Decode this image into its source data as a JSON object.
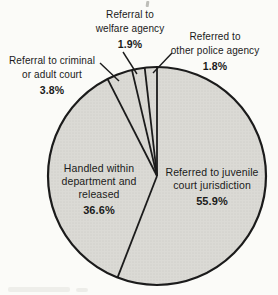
{
  "figure": {
    "background_color": "#fbfbf8"
  },
  "chart_data": {
    "type": "pie",
    "title": "",
    "unit": "percent",
    "direction": "clockwise",
    "start_angle_clockwise_from_top_deg": 0,
    "categories": [
      "Referred to juvenile court jurisdiction",
      "Handled within department and released",
      "Referral to criminal or adult court",
      "Referral to welfare agency",
      "Referred to other police agency"
    ],
    "values": [
      55.9,
      36.6,
      3.8,
      1.9,
      1.8
    ],
    "slices": [
      {
        "category": "Referred to juvenile court jurisdiction",
        "value": 55.9,
        "pct_label": "55.9%",
        "label_lines": [
          "Referred to juvenile",
          "court jurisdiction"
        ],
        "label_placement": "inside-right",
        "leader_line": false
      },
      {
        "category": "Handled within department and released",
        "value": 36.6,
        "pct_label": "36.6%",
        "label_lines": [
          "Handled within",
          "department and",
          "released"
        ],
        "label_placement": "inside-left",
        "leader_line": false
      },
      {
        "category": "Referral to criminal or adult court",
        "value": 3.8,
        "pct_label": "3.8%",
        "label_lines": [
          "Referral to criminal",
          "or adult court"
        ],
        "label_placement": "outside-upper-left",
        "leader_line": true
      },
      {
        "category": "Referral to welfare agency",
        "value": 1.9,
        "pct_label": "1.9%",
        "label_lines": [
          "Referral to",
          "welfare agency"
        ],
        "label_placement": "outside-top",
        "leader_line": true
      },
      {
        "category": "Referred to other police agency",
        "value": 1.8,
        "pct_label": "1.8%",
        "label_lines": [
          "Referred to",
          "other police agency"
        ],
        "label_placement": "outside-upper-right",
        "leader_line": true
      }
    ],
    "colors": {
      "slice_fill": "#dbdad5",
      "slice_stipple_dot": "#c8c7c1",
      "outline": "#1b1b1b",
      "label_text": "#1a1a1a",
      "background": "#fbfbf8"
    },
    "legend": "none",
    "grid": "off"
  }
}
